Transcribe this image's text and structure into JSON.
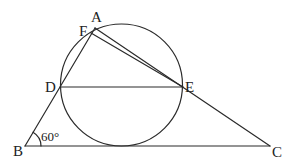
{
  "diagram": {
    "type": "geometry",
    "points": {
      "A": {
        "label": "A",
        "x": 95,
        "y": 28
      },
      "F": {
        "label": "F",
        "x": 91,
        "y": 33
      },
      "D": {
        "label": "D",
        "x": 60,
        "y": 87
      },
      "E": {
        "label": "E",
        "x": 183,
        "y": 87
      },
      "B": {
        "label": "B",
        "x": 25,
        "y": 146
      },
      "C": {
        "label": "C",
        "x": 270,
        "y": 146
      }
    },
    "circle": {
      "cx": 121.5,
      "cy": 85,
      "r": 61
    },
    "segments": [
      [
        "A",
        "B"
      ],
      [
        "A",
        "C"
      ],
      [
        "B",
        "C"
      ],
      [
        "D",
        "E"
      ],
      [
        "F",
        "E"
      ]
    ],
    "angle": {
      "vertex": "B",
      "label": "60°",
      "value_degrees": 60
    },
    "colors": {
      "stroke": "#2a2a2a",
      "text": "#222222",
      "background": "#ffffff"
    }
  }
}
